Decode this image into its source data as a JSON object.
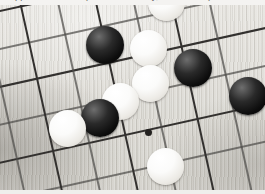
{
  "image": {
    "kind": "photograph",
    "subject": "go-board",
    "width": 265,
    "height": 194,
    "caption_strip_text": "cropped line of text (descenders only, unreadable)"
  },
  "board": {
    "label": "Go board (goban)",
    "wood_color": "#dedcd6",
    "line_color": "#4e4c49",
    "grain": "fine vertical wood grain",
    "rotation_degrees": -12.5,
    "grid_spacing_px": 37,
    "star_point_color": "#23211f",
    "star_points": [
      {
        "name": "hoshi",
        "x": 148,
        "y": 132,
        "d": 7
      }
    ],
    "lines": {
      "horizontal_count": 6,
      "vertical_count": 8
    }
  },
  "stones": {
    "black_color": "#0c0c0c",
    "white_color": "#fbfbfa",
    "black_count": 4,
    "white_count": 6,
    "items": [
      {
        "name": "white-stone-top-partial",
        "color": "white",
        "x": 166,
        "y": 2,
        "d": 37
      },
      {
        "name": "black-stone-upper-left",
        "color": "black",
        "x": 105,
        "y": 45,
        "d": 38
      },
      {
        "name": "white-stone-upper-mid",
        "color": "white",
        "x": 148,
        "y": 48,
        "d": 37
      },
      {
        "name": "black-stone-upper-right",
        "color": "black",
        "x": 193,
        "y": 68,
        "d": 38
      },
      {
        "name": "white-stone-center",
        "color": "white",
        "x": 150,
        "y": 83,
        "d": 37
      },
      {
        "name": "white-stone-center-left",
        "color": "white",
        "x": 120,
        "y": 101,
        "d": 37
      },
      {
        "name": "black-stone-lower-mid",
        "color": "black",
        "x": 100,
        "y": 118,
        "d": 38
      },
      {
        "name": "black-stone-right-edge",
        "color": "black",
        "x": 248,
        "y": 96,
        "d": 38
      },
      {
        "name": "white-stone-lower-left",
        "color": "white",
        "x": 67,
        "y": 128,
        "d": 37
      },
      {
        "name": "white-stone-bottom",
        "color": "white",
        "x": 165,
        "y": 166,
        "d": 37
      }
    ]
  },
  "borders": {
    "top_strip_color": "#f4f3f1",
    "bottom_strip_color": "#efeeec"
  }
}
